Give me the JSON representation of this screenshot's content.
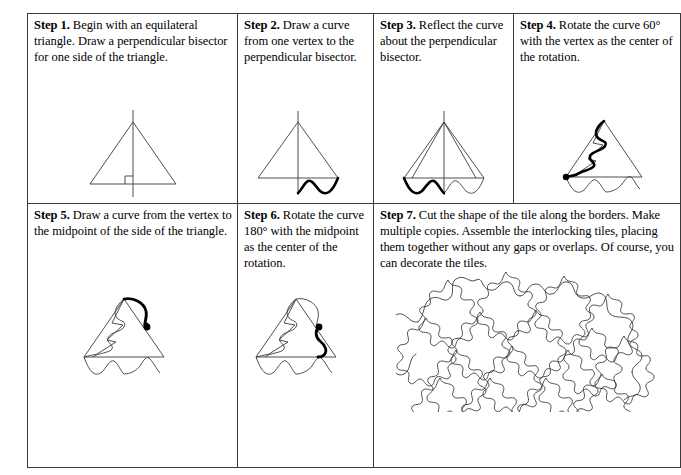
{
  "document": {
    "title": "Tessellation tile construction steps",
    "background_color": "#ffffff",
    "border_color": "#3a3a3a",
    "stroke_color": "#000000"
  },
  "steps": [
    {
      "id": "step-1",
      "label": "Step 1.",
      "text": " Begin with an equilateral triangle. Draw a perpendicular bisector for one side of the triangle.",
      "figure": "triangle-with-perpendicular-bisector"
    },
    {
      "id": "step-2",
      "label": "Step 2.",
      "text": " Draw a curve from one vertex to the perpendicular bisector.",
      "figure": "triangle-with-curve-from-vertex"
    },
    {
      "id": "step-3",
      "label": "Step 3.",
      "text": " Reflect the curve about the perpendicular bisector.",
      "figure": "triangle-with-reflected-curve"
    },
    {
      "id": "step-4",
      "label": "Step 4.",
      "text": " Rotate the curve 60°  with the vertex as the center of the rotation.",
      "figure": "triangle-with-rotated-curve-60"
    },
    {
      "id": "step-5",
      "label": "Step 5.",
      "text": " Draw a curve from the vertex to the midpoint of the side of the triangle.",
      "figure": "triangle-with-curve-to-midpoint"
    },
    {
      "id": "step-6",
      "label": "Step 6.",
      "text": " Rotate the curve 180°  with the midpoint as the center of the rotation.",
      "figure": "triangle-with-rotated-curve-180"
    },
    {
      "id": "step-7",
      "label": "Step 7.",
      "text": " Cut the shape of the tile along the borders. Make multiple copies. Assemble the interlocking tiles, placing them together without any gaps or overlaps. Of course, you can decorate the tiles.",
      "figure": "tessellation-of-interlocking-tiles"
    }
  ]
}
